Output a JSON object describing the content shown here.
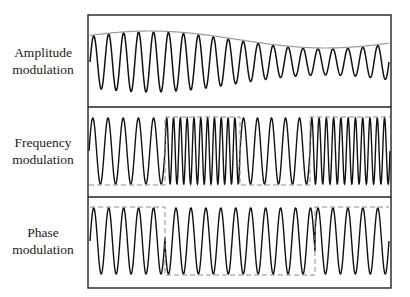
{
  "panels": [
    {
      "id": "am",
      "label_line1": "Amplitude",
      "label_line2": "modulation"
    },
    {
      "id": "fm",
      "label_line1": "Frequency",
      "label_line2": "modulation"
    },
    {
      "id": "pm",
      "label_line1": "Phase",
      "label_line2": "modulation"
    }
  ],
  "frame": {
    "x": 88,
    "y": 15,
    "w": 303,
    "h": 273,
    "dividers_y": [
      107,
      197
    ]
  },
  "signal": {
    "am": {
      "cycles": 20,
      "envelope": "high at left, dips near x=300, rises at right",
      "envelope_color": "#9a9a9a"
    },
    "fm": {
      "segments": [
        {
          "x_start": 89,
          "x_end": 165,
          "cycles": 5,
          "bit": 0
        },
        {
          "x_start": 165,
          "x_end": 240,
          "cycles": 11,
          "bit": 1
        },
        {
          "x_start": 240,
          "x_end": 310,
          "cycles": 5,
          "bit": 0
        },
        {
          "x_start": 310,
          "x_end": 390,
          "cycles": 11,
          "bit": 1
        }
      ]
    },
    "pm": {
      "cycles": 20,
      "phase_flips_x": [
        165,
        315
      ],
      "bits": [
        1,
        0,
        1
      ]
    }
  },
  "colors": {
    "wave": "#111111",
    "frame": "#222222",
    "dashed": "#8a8a8a"
  }
}
